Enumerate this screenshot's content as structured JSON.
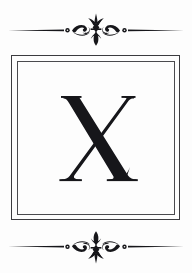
{
  "card": {
    "type": "monogram-card",
    "background_color": "#fdfdfd",
    "ink_color": "#16161a",
    "frame": {
      "outer_line_color": "#3b3b3f",
      "inner_line_color": "#4a4a4e",
      "style": "double-rule-rectangle"
    },
    "monogram": {
      "letter": "X",
      "typeface_style": "didone-high-contrast-serif",
      "color": "#16161a"
    },
    "ornaments": [
      {
        "name": "top-ornament",
        "motif": "fleur-de-lis-with-scrolls-and-rules",
        "orientation": "up",
        "color": "#16161a"
      },
      {
        "name": "bottom-ornament",
        "motif": "fleur-de-lis-with-scrolls-and-rules",
        "orientation": "down",
        "color": "#16161a"
      }
    ]
  }
}
